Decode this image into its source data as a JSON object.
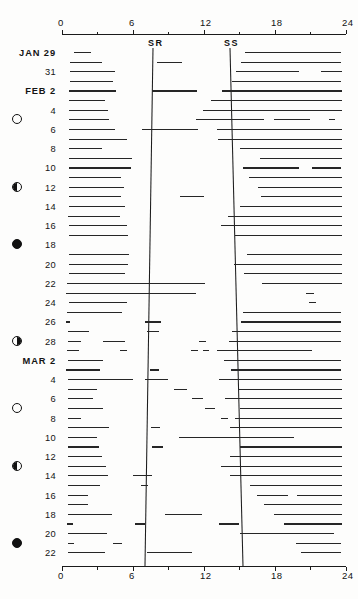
{
  "figure": {
    "type": "actogram",
    "axis_top_labels": [
      "0",
      "6",
      "12",
      "18",
      "24"
    ],
    "axis_bottom_labels": [
      "0",
      "6",
      "12",
      "18",
      "24"
    ],
    "sunrise_label": "SR",
    "sunset_label": "SS"
  },
  "chart_data": {
    "type": "bar",
    "title": "",
    "subtitle": "",
    "xlabel": "",
    "ylabel": "",
    "xlim": [
      0,
      24
    ],
    "grid": false,
    "legend": null,
    "axis_ticks": [
      0,
      6,
      12,
      18,
      24
    ],
    "minor_ticks": [
      3,
      9,
      15,
      21
    ],
    "annotations": [
      "SR",
      "SS"
    ],
    "sunrise_curve": [
      {
        "date": "JAN 29",
        "hour": 7.7
      },
      {
        "date": "MAR 22",
        "hour": 7.05
      }
    ],
    "sunset_curve": [
      {
        "date": "JAN 29",
        "hour": 14.25
      },
      {
        "date": "MAR 22",
        "hour": 15.3
      }
    ],
    "categories": [
      "JAN 29",
      "30",
      "31",
      "FEB 1",
      "2",
      "3",
      "4",
      "5",
      "6",
      "7",
      "8",
      "9",
      "10",
      "11",
      "12",
      "13",
      "14",
      "15",
      "16",
      "17",
      "18",
      "19",
      "20",
      "21",
      "22",
      "23",
      "24",
      "25",
      "26",
      "27",
      "28",
      "MAR 1",
      "2",
      "3",
      "4",
      "5",
      "6",
      "7",
      "8",
      "9",
      "10",
      "11",
      "12",
      "13",
      "14",
      "15",
      "16",
      "17",
      "18",
      "19",
      "20",
      "21",
      "22"
    ],
    "rows": [
      {
        "label": "JAN 29",
        "bold": true,
        "moon": null,
        "bouts": [
          [
            1.05,
            2.45
          ],
          [
            15.5,
            23.6
          ]
        ]
      },
      {
        "label": "",
        "bold": false,
        "moon": null,
        "bouts": [
          [
            0.7,
            3.4
          ],
          [
            8.0,
            10.1
          ],
          [
            15.1,
            23.6
          ]
        ]
      },
      {
        "label": "31",
        "bold": false,
        "moon": null,
        "bouts": [
          [
            0.7,
            4.5
          ],
          [
            14.7,
            20.0
          ],
          [
            21.9,
            23.7
          ]
        ]
      },
      {
        "label": "",
        "bold": false,
        "moon": null,
        "bouts": [
          [
            0.65,
            4.3
          ],
          [
            14.4,
            23.6
          ]
        ]
      },
      {
        "label": "FEB 2",
        "bold": true,
        "moon": null,
        "bouts": [
          [
            0.6,
            4.6
          ],
          [
            7.6,
            11.4
          ],
          [
            13.5,
            23.7
          ]
        ]
      },
      {
        "label": "",
        "bold": false,
        "moon": null,
        "bouts": [
          [
            0.6,
            3.6
          ],
          [
            12.6,
            23.7
          ]
        ]
      },
      {
        "label": "4",
        "bold": false,
        "moon": null,
        "bouts": [
          [
            0.6,
            3.9
          ],
          [
            11.9,
            23.7
          ]
        ]
      },
      {
        "label": "",
        "bold": false,
        "moon": "new",
        "bouts": [
          [
            0.6,
            4.0
          ],
          [
            11.3,
            17.1
          ],
          [
            17.9,
            21.0
          ],
          [
            22.6,
            23.1
          ]
        ]
      },
      {
        "label": "6",
        "bold": false,
        "moon": null,
        "bouts": [
          [
            0.6,
            4.5
          ],
          [
            6.8,
            11.5
          ],
          [
            13.1,
            23.7
          ]
        ]
      },
      {
        "label": "",
        "bold": false,
        "moon": null,
        "bouts": [
          [
            0.6,
            5.5
          ],
          [
            13.2,
            23.7
          ]
        ]
      },
      {
        "label": "8",
        "bold": false,
        "moon": null,
        "bouts": [
          [
            0.6,
            3.4
          ],
          [
            15.0,
            23.7
          ]
        ]
      },
      {
        "label": "",
        "bold": false,
        "moon": null,
        "bouts": [
          [
            0.6,
            5.9
          ],
          [
            16.7,
            23.7
          ]
        ]
      },
      {
        "label": "10",
        "bold": false,
        "moon": null,
        "bouts": [
          [
            0.6,
            5.8
          ],
          [
            15.3,
            20.0
          ],
          [
            21.1,
            23.6
          ]
        ]
      },
      {
        "label": "",
        "bold": false,
        "moon": null,
        "bouts": [
          [
            0.6,
            5.0
          ],
          [
            15.8,
            23.7
          ]
        ]
      },
      {
        "label": "12",
        "bold": false,
        "moon": "first-quarter",
        "bouts": [
          [
            0.6,
            5.2
          ],
          [
            16.6,
            23.7
          ]
        ]
      },
      {
        "label": "",
        "bold": false,
        "moon": null,
        "bouts": [
          [
            0.6,
            5.0
          ],
          [
            10.0,
            12.0
          ],
          [
            16.8,
            23.7
          ]
        ]
      },
      {
        "label": "14",
        "bold": false,
        "moon": null,
        "bouts": [
          [
            0.6,
            5.3
          ],
          [
            15.0,
            23.7
          ]
        ]
      },
      {
        "label": "",
        "bold": false,
        "moon": null,
        "bouts": [
          [
            0.5,
            4.9
          ],
          [
            14.0,
            23.7
          ]
        ]
      },
      {
        "label": "16",
        "bold": false,
        "moon": null,
        "bouts": [
          [
            0.6,
            5.5
          ],
          [
            13.4,
            23.7
          ]
        ]
      },
      {
        "label": "",
        "bold": false,
        "moon": null,
        "bouts": [
          [
            0.6,
            5.6
          ],
          [
            14.6,
            23.7
          ]
        ]
      },
      {
        "label": "18",
        "bold": false,
        "moon": "full"
      },
      {
        "label": "",
        "bold": false,
        "moon": null,
        "bouts": [
          [
            0.6,
            5.7
          ],
          [
            15.6,
            23.7
          ]
        ]
      },
      {
        "label": "20",
        "bold": false,
        "moon": null,
        "bouts": [
          [
            0.6,
            5.6
          ],
          [
            14.5,
            23.7
          ]
        ]
      },
      {
        "label": "",
        "bold": false,
        "moon": null,
        "bouts": [
          [
            0.6,
            5.3
          ],
          [
            15.4,
            23.7
          ]
        ]
      },
      {
        "label": "22",
        "bold": false,
        "moon": null,
        "bouts": [
          [
            0.4,
            12.1
          ],
          [
            16.9,
            23.7
          ]
        ]
      },
      {
        "label": "",
        "bold": false,
        "moon": null,
        "bouts": [
          [
            0.35,
            11.3
          ],
          [
            20.6,
            21.3
          ]
        ]
      },
      {
        "label": "24",
        "bold": false,
        "moon": null,
        "bouts": [
          [
            0.55,
            5.5
          ],
          [
            20.9,
            21.5
          ]
        ]
      },
      {
        "label": "",
        "bold": false,
        "moon": null,
        "bouts": [
          [
            0.45,
            5.1
          ],
          [
            15.3,
            23.6
          ]
        ]
      },
      {
        "label": "26",
        "bold": false,
        "moon": null,
        "bouts": [
          [
            0.3,
            0.7
          ],
          [
            7.0,
            8.4
          ],
          [
            15.1,
            23.6
          ]
        ]
      },
      {
        "label": "",
        "bold": false,
        "moon": null,
        "bouts": [
          [
            0.5,
            2.3
          ],
          [
            7.2,
            8.2
          ],
          [
            14.4,
            23.6
          ]
        ]
      },
      {
        "label": "28",
        "bold": false,
        "moon": "last-quarter",
        "bouts": [
          [
            0.5,
            1.6
          ],
          [
            3.5,
            5.3
          ],
          [
            11.6,
            12.2
          ],
          [
            14.1,
            23.6
          ]
        ]
      },
      {
        "label": "",
        "bold": false,
        "moon": null,
        "bouts": [
          [
            0.45,
            1.4
          ],
          [
            4.9,
            5.5
          ],
          [
            10.9,
            11.5
          ],
          [
            11.9,
            12.4
          ],
          [
            13.1,
            21.1
          ]
        ]
      },
      {
        "label": "MAR 2",
        "bold": true,
        "moon": null,
        "bouts": [
          [
            0.5,
            3.5
          ],
          [
            13.7,
            23.6
          ]
        ]
      },
      {
        "label": "",
        "bold": false,
        "moon": null,
        "bouts": [
          [
            0.35,
            0.6
          ],
          [
            0.5,
            3.2
          ],
          [
            7.4,
            8.2
          ],
          [
            14.3,
            23.6
          ]
        ]
      },
      {
        "label": "4",
        "bold": false,
        "moon": null,
        "bouts": [
          [
            0.5,
            6.0
          ],
          [
            7.0,
            9.0
          ],
          [
            13.3,
            23.7
          ]
        ]
      },
      {
        "label": "",
        "bold": false,
        "moon": null,
        "bouts": [
          [
            0.5,
            3.0
          ],
          [
            9.5,
            10.6
          ],
          [
            14.9,
            23.7
          ]
        ]
      },
      {
        "label": "6",
        "bold": false,
        "moon": null,
        "bouts": [
          [
            0.5,
            2.6
          ],
          [
            11.0,
            11.9
          ],
          [
            13.8,
            23.7
          ]
        ]
      },
      {
        "label": "",
        "bold": false,
        "moon": "new",
        "bouts": [
          [
            0.5,
            3.5
          ],
          [
            12.1,
            12.9
          ],
          [
            15.0,
            23.7
          ]
        ]
      },
      {
        "label": "8",
        "bold": false,
        "moon": null,
        "bouts": [
          [
            0.5,
            1.6
          ],
          [
            13.4,
            14.0
          ],
          [
            14.6,
            23.7
          ]
        ]
      },
      {
        "label": "",
        "bold": false,
        "moon": null,
        "bouts": [
          [
            0.5,
            4.0
          ],
          [
            7.5,
            8.3
          ],
          [
            14.2,
            23.7
          ]
        ]
      },
      {
        "label": "10",
        "bold": false,
        "moon": null,
        "bouts": [
          [
            0.5,
            3.0
          ],
          [
            9.9,
            19.6
          ]
        ]
      },
      {
        "label": "",
        "bold": false,
        "moon": null,
        "bouts": [
          [
            0.5,
            3.1
          ],
          [
            7.6,
            8.5
          ],
          [
            15.0,
            23.7
          ]
        ]
      },
      {
        "label": "12",
        "bold": false,
        "moon": null,
        "bouts": [
          [
            0.5,
            3.4
          ],
          [
            14.2,
            23.7
          ]
        ]
      },
      {
        "label": "",
        "bold": false,
        "moon": "first-quarter",
        "bouts": [
          [
            0.5,
            3.7
          ],
          [
            13.4,
            23.7
          ]
        ]
      },
      {
        "label": "14",
        "bold": false,
        "moon": null,
        "bouts": [
          [
            0.5,
            3.9
          ],
          [
            6.0,
            7.6
          ],
          [
            14.2,
            23.7
          ]
        ]
      },
      {
        "label": "",
        "bold": false,
        "moon": null,
        "bouts": [
          [
            0.5,
            3.2
          ],
          [
            6.7,
            7.3
          ],
          [
            15.9,
            23.7
          ]
        ]
      },
      {
        "label": "16",
        "bold": false,
        "moon": null,
        "bouts": [
          [
            0.5,
            2.2
          ],
          [
            16.5,
            19.1
          ],
          [
            19.9,
            23.7
          ]
        ]
      },
      {
        "label": "",
        "bold": false,
        "moon": null,
        "bouts": [
          [
            0.5,
            2.2
          ],
          [
            17.1,
            23.7
          ]
        ]
      },
      {
        "label": "18",
        "bold": false,
        "moon": null,
        "bouts": [
          [
            0.5,
            4.2
          ],
          [
            8.7,
            11.8
          ],
          [
            17.9,
            23.7
          ]
        ]
      },
      {
        "label": "",
        "bold": false,
        "moon": null,
        "bouts": [
          [
            0.4,
            0.9
          ],
          [
            6.2,
            7.0
          ],
          [
            13.3,
            15.0
          ],
          [
            18.8,
            23.7
          ]
        ]
      },
      {
        "label": "20",
        "bold": false,
        "moon": null,
        "bouts": [
          [
            0.5,
            3.8
          ],
          [
            15.0,
            23.0
          ]
        ]
      },
      {
        "label": "",
        "bold": false,
        "moon": "full",
        "bouts": [
          [
            0.5,
            1.0
          ],
          [
            4.3,
            5.1
          ],
          [
            19.8,
            23.6
          ]
        ]
      },
      {
        "label": "22",
        "bold": false,
        "moon": null,
        "bouts": [
          [
            0.5,
            3.6
          ],
          [
            7.2,
            11.0
          ],
          [
            20.2,
            23.6
          ]
        ]
      }
    ]
  }
}
